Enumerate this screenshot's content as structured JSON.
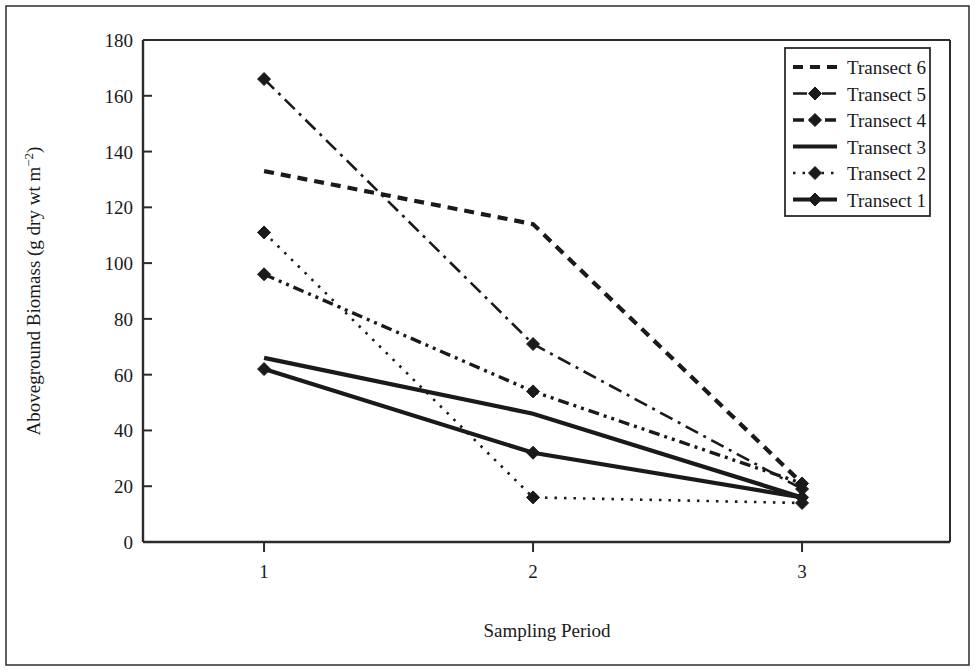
{
  "chart_data": {
    "type": "line",
    "title": "",
    "xlabel": "Sampling Period",
    "ylabel": "Aboveground Biomass (g dry wt m−2)",
    "ylabel_parts": {
      "main": "Aboveground Biomass (g dry wt m",
      "sup": "−2",
      "tail": ")"
    },
    "x": [
      1,
      2,
      3
    ],
    "xtick_labels": [
      "1",
      "2",
      "3"
    ],
    "ytick_labels": [
      "0",
      "20",
      "40",
      "60",
      "80",
      "100",
      "120",
      "140",
      "160",
      "180"
    ],
    "ytick_values": [
      0,
      20,
      40,
      60,
      80,
      100,
      120,
      140,
      160,
      180
    ],
    "ylim": [
      0,
      180
    ],
    "xlim": [
      0.55,
      3.55
    ],
    "grid": false,
    "legend_position": "top-right",
    "series": [
      {
        "name": "Transect 6",
        "values": [
          133,
          114,
          21
        ],
        "style": "dashed",
        "marker": "none",
        "width": 4.2,
        "dash": "10,7",
        "color": "#1a1a1a"
      },
      {
        "name": "Transect 5",
        "values": [
          166,
          71,
          19
        ],
        "style": "dash-dot",
        "marker": "diamond",
        "width": 2.6,
        "dash": "14,6,3,6",
        "color": "#1a1a1a"
      },
      {
        "name": "Transect 4",
        "values": [
          96,
          54,
          21
        ],
        "style": "dash-dot-dot",
        "marker": "diamond",
        "width": 3.4,
        "dash": "11,5,3,5,3,5",
        "color": "#1a1a1a"
      },
      {
        "name": "Transect 3",
        "values": [
          66,
          46,
          16
        ],
        "style": "solid",
        "marker": "none",
        "width": 4.2,
        "dash": "none",
        "color": "#1a1a1a"
      },
      {
        "name": "Transect 2",
        "values": [
          111,
          16,
          14
        ],
        "style": "dotted",
        "marker": "diamond",
        "width": 2.6,
        "dash": "2.5,7",
        "color": "#1a1a1a"
      },
      {
        "name": "Transect 1",
        "values": [
          62,
          32,
          16
        ],
        "style": "solid",
        "marker": "diamond",
        "width": 4.2,
        "dash": "none",
        "color": "#1a1a1a"
      }
    ],
    "legend_entries": [
      "Transect 6",
      "Transect 5",
      "Transect 4",
      "Transect 3",
      "Transect 2",
      "Transect 1"
    ]
  },
  "figure": {
    "border_color": "#3a3a3a",
    "axis_color": "#2b2b2b",
    "background": "#ffffff"
  }
}
